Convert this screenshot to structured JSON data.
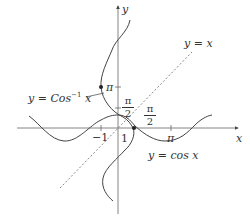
{
  "diagram": {
    "title": "",
    "axes": {
      "x_label": "x",
      "y_label": "y",
      "x_ticks": [
        {
          "label": "−1",
          "value": -1
        },
        {
          "label": "1",
          "value": 1
        },
        {
          "label": "π",
          "value": 3.14159
        }
      ],
      "y_ticks": [
        {
          "label": "π",
          "value": 3.14159
        }
      ]
    },
    "curves": [
      {
        "name": "y = cos x",
        "label": "y = cos x",
        "style": "solid"
      },
      {
        "name": "y = Cos⁻¹ x",
        "label_prefix": "y = Cos",
        "label_sup": "−1",
        "label_suffix": " x",
        "style": "solid"
      },
      {
        "name": "y = x",
        "label": "y = x",
        "style": "dashed"
      }
    ],
    "annotations": {
      "pi_over_2_y": {
        "num": "π",
        "den": "2"
      },
      "pi_over_2_x": {
        "num": "π",
        "den": "2"
      }
    },
    "points": [
      {
        "label": "(−1, π)",
        "x": -1,
        "y": 3.14159
      },
      {
        "label": "(1, 0)",
        "x": 1,
        "y": 0
      }
    ],
    "colors": {
      "curve": "#444444",
      "axis": "#555555",
      "dashed": "#888888"
    }
  }
}
